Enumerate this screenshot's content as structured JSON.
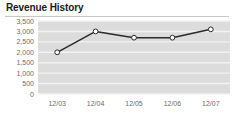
{
  "widget": {
    "title": "Revenue History"
  },
  "chart_data": {
    "type": "line",
    "title": "Revenue History",
    "xlabel": "",
    "ylabel": "",
    "categories": [
      "12/03",
      "12/04",
      "12/05",
      "12/06",
      "12/07"
    ],
    "values": [
      2000,
      3000,
      2700,
      2700,
      3100
    ],
    "series": [
      {
        "name": "Revenue",
        "values": [
          2000,
          3000,
          2700,
          2700,
          3100
        ]
      }
    ],
    "ylim": [
      0,
      3500
    ],
    "ytick_labels": [
      "3,500",
      "3,000",
      "2,500",
      "2,000",
      "1,500",
      "1,000",
      "500",
      "0"
    ],
    "ytick_values": [
      3500,
      3000,
      2500,
      2000,
      1500,
      1000,
      500,
      0
    ],
    "grid": true,
    "legend": false,
    "colors": {
      "line": "#2b2b2b",
      "marker_fill": "#ffffff",
      "marker_stroke": "#2b2b2b",
      "plot_background": "#dcdcdc",
      "gridline": "#f2f2f2",
      "axis_text": "#6b6b6b",
      "title_text": "#1a1a1a",
      "divider": "#c8c8c8"
    }
  }
}
